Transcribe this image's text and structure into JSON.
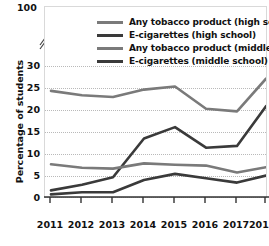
{
  "chart_data": {
    "type": "line",
    "title": "",
    "xlabel": "",
    "ylabel": "Percentage of students",
    "x": [
      2011,
      2012,
      2013,
      2014,
      2015,
      2016,
      2017,
      2018
    ],
    "xtick_labels": [
      "2011",
      "2012",
      "2013",
      "2014",
      "2015",
      "2016",
      "2017",
      "201"
    ],
    "ytick_labels": [
      "0",
      "5",
      "10",
      "15",
      "20",
      "25",
      "30",
      "100"
    ],
    "yticks": [
      0,
      5,
      10,
      15,
      20,
      25,
      30
    ],
    "ylim": [
      0,
      30
    ],
    "y_axis_break": true,
    "y_axis_break_top_label": "100",
    "grid": "horizontal-dotted",
    "legend_position": "top-inside",
    "series": [
      {
        "name": "Any tobacco product (high school)",
        "color": "#7a7a7a",
        "values": [
          24.3,
          23.3,
          22.9,
          24.6,
          25.3,
          20.2,
          19.6,
          27.1
        ]
      },
      {
        "name": "E-cigarettes (high school)",
        "color": "#3a3a3a",
        "values": [
          1.5,
          2.8,
          4.5,
          13.4,
          16.0,
          11.3,
          11.7,
          20.8
        ]
      },
      {
        "name": "Any tobacco product (middle school)",
        "color": "#7a7a7a",
        "values": [
          7.5,
          6.7,
          6.5,
          7.7,
          7.4,
          7.2,
          5.6,
          6.8
        ]
      },
      {
        "name": "E-cigarettes (middle school)",
        "color": "#3a3a3a",
        "values": [
          0.6,
          1.1,
          1.1,
          3.9,
          5.3,
          4.3,
          3.3,
          4.9
        ]
      }
    ]
  }
}
